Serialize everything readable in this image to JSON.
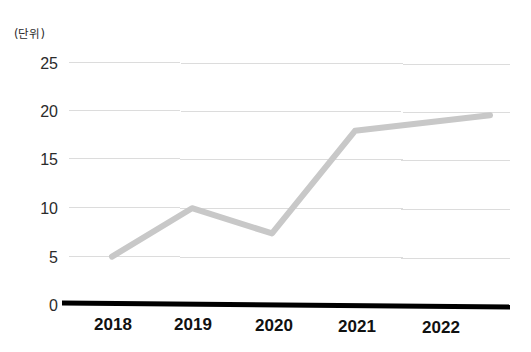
{
  "chart_data": {
    "type": "line",
    "title": "",
    "subtitle": "",
    "unit_label": "(단위)",
    "xlabel": "",
    "ylabel": "",
    "categories": [
      "2018",
      "2019",
      "2020",
      "2021",
      "2022"
    ],
    "values": [
      5.0,
      10.0,
      7.4,
      18.0,
      19.6
    ],
    "series": [
      {
        "name": "",
        "values": [
          5.0,
          10.0,
          7.4,
          18.0,
          19.6
        ],
        "color": "#c8c8c8"
      }
    ],
    "ylim": [
      0,
      25
    ],
    "yticks": [
      0,
      5,
      10,
      15,
      20,
      25
    ],
    "ytick_labels": [
      "0",
      "5",
      "10",
      "15",
      "20",
      "25"
    ],
    "xtick_labels": [
      "2018",
      "2019",
      "2020",
      "2021",
      "2022"
    ],
    "grid": true,
    "grid_axis": "y",
    "grid_color": "#dcdcdc",
    "legend": false,
    "legend_position": "none",
    "axis_color": "#000000",
    "background": "#ffffff"
  },
  "axes": {
    "y_labels": [
      {
        "text": "25",
        "value": 25
      },
      {
        "text": "20",
        "value": 20
      },
      {
        "text": "15",
        "value": 15
      },
      {
        "text": "10",
        "value": 10
      },
      {
        "text": "5",
        "value": 5
      },
      {
        "text": "0",
        "value": 0
      }
    ],
    "x_labels": [
      {
        "text": "2018"
      },
      {
        "text": "2019"
      },
      {
        "text": "2020"
      },
      {
        "text": "2021"
      },
      {
        "text": "2022"
      }
    ]
  },
  "annotations": {
    "unit": "(단위)"
  },
  "colors": {
    "line": "#c8c8c8",
    "grid": "#dcdcdc",
    "axis": "#000000",
    "text": "#2b2b2b",
    "xtick_text": "#111111",
    "background": "#ffffff"
  }
}
